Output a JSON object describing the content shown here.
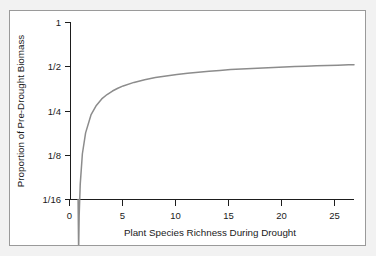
{
  "figure": {
    "panel_background": "#ffffff",
    "outer_background": "#f2f2f2",
    "border_color": "#9a9a9a"
  },
  "chart_data": {
    "type": "line",
    "title": "",
    "subtitle": "",
    "xlabel": "Plant Species Richness During Drought",
    "ylabel": "Proportion of Pre-Drought Biomass",
    "grid": false,
    "legend": "none",
    "axis_color": "#1d1d1d",
    "series_color": "#8c8c8c",
    "xlim": [
      0,
      26.5
    ],
    "xticks": [
      0,
      5,
      10,
      15,
      20,
      25
    ],
    "xticklabels": [
      "0",
      "5",
      "10",
      "15",
      "20",
      "25"
    ],
    "yscale": "log2",
    "ylim": [
      0.0442,
      1.0
    ],
    "yticks": [
      1,
      0.5,
      0.25,
      0.125,
      0.0625
    ],
    "yticklabels": [
      "1",
      "1/2",
      "1/4",
      "1/8",
      "1/16"
    ],
    "series": [
      {
        "name": "biomass-response",
        "x": [
          0.8,
          0.85,
          0.9,
          1.0,
          1.2,
          1.5,
          2.0,
          2.5,
          3.0,
          3.5,
          4.0,
          4.5,
          5.0,
          6.0,
          7.0,
          8.0,
          9.0,
          10.0,
          11.0,
          12.0,
          13.0,
          14.0,
          15.0,
          16.0,
          17.0,
          18.0,
          19.0,
          20.0,
          21.0,
          22.0,
          23.0,
          24.0,
          25.0,
          26.0,
          26.5
        ],
        "y": [
          0.0,
          0.018,
          0.033,
          0.058,
          0.099,
          0.143,
          0.196,
          0.232,
          0.26,
          0.281,
          0.299,
          0.314,
          0.327,
          0.348,
          0.365,
          0.379,
          0.39,
          0.4,
          0.409,
          0.417,
          0.424,
          0.43,
          0.436,
          0.441,
          0.445,
          0.449,
          0.453,
          0.457,
          0.46,
          0.463,
          0.466,
          0.469,
          0.471,
          0.474,
          0.475
        ]
      }
    ],
    "annotations": []
  }
}
